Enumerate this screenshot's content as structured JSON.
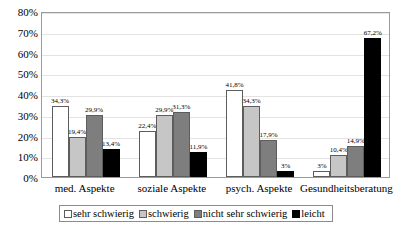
{
  "chart_data": {
    "type": "bar",
    "title": "",
    "subtitle": "",
    "xlabel": "",
    "ylabel": "",
    "ylim": [
      0,
      80
    ],
    "ytick_labels": [
      "0%",
      "10%",
      "20%",
      "30%",
      "40%",
      "50%",
      "60%",
      "70%",
      "80%"
    ],
    "ytick_values": [
      0,
      10,
      20,
      30,
      40,
      50,
      60,
      70,
      80
    ],
    "grid": true,
    "legend_position": "bottom",
    "categories": [
      "med. Aspekte",
      "soziale Aspekte",
      "psych. Aspekte",
      "Gesundheitsberatung"
    ],
    "series": [
      {
        "name": "sehr schwierig",
        "color": "#ffffff",
        "values": [
          34.3,
          22.4,
          41.8,
          3
        ],
        "labels": [
          "34,3%",
          "22,4%",
          "41,8%",
          "3%"
        ]
      },
      {
        "name": "schwierig",
        "color": "#c6c6c6",
        "values": [
          19.4,
          29.9,
          34.3,
          10.4
        ],
        "labels": [
          "19,4%",
          "29,9%",
          "34,3%",
          "10,4%"
        ]
      },
      {
        "name": "nicht sehr schwierig",
        "color": "#7e7e7e",
        "values": [
          29.9,
          31.3,
          17.9,
          14.9
        ],
        "labels": [
          "29,9%",
          "31,3%",
          "17,9%",
          "14,9%"
        ]
      },
      {
        "name": "leicht",
        "color": "#000000",
        "values": [
          13.4,
          11.9,
          3,
          67.2
        ],
        "labels": [
          "13,4%",
          "11,9%",
          "3%",
          "67,2%"
        ]
      }
    ]
  },
  "legend": {
    "items": [
      {
        "label": "sehr schwierig"
      },
      {
        "label": "schwierig"
      },
      {
        "label": "nicht sehr schwierig"
      },
      {
        "label": "leicht"
      }
    ]
  }
}
